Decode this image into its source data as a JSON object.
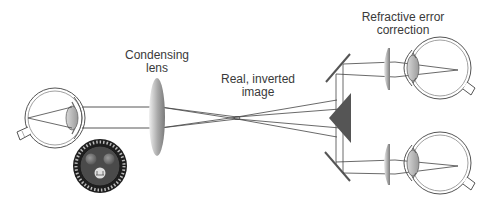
{
  "labels": {
    "condensing_lens_line1": "Condensing",
    "condensing_lens_line2": "lens",
    "real_image_line1": "Real, inverted",
    "real_image_line2": "image",
    "refractive_line1": "Refractive error",
    "refractive_line2": "correction"
  },
  "components": [
    {
      "name": "observed-eye",
      "description": "Patient eye (left)"
    },
    {
      "name": "reticle-disk",
      "description": "Viewing target / reticle"
    },
    {
      "name": "condensing-lens",
      "description": "Condensing lens"
    },
    {
      "name": "real-inverted-image",
      "description": "Real, inverted image (ray crossover)"
    },
    {
      "name": "prism",
      "description": "Beam-splitting prism"
    },
    {
      "name": "upper-mirror",
      "description": "Upper mirror"
    },
    {
      "name": "lower-mirror",
      "description": "Lower mirror"
    },
    {
      "name": "upper-correction-lens",
      "description": "Refractive error correction lens (upper)"
    },
    {
      "name": "lower-correction-lens",
      "description": "Refractive error correction lens (lower)"
    },
    {
      "name": "observer-eye-upper",
      "description": "Observer eye (upper)"
    },
    {
      "name": "observer-eye-lower",
      "description": "Observer eye (lower)"
    }
  ],
  "colors": {
    "line": "#444444",
    "prism": "#555555",
    "lens_dark": "#8a8a8a",
    "lens_light": "#e8e8e8",
    "reticle": "#1e1e1e",
    "text": "#3a3a3a"
  }
}
